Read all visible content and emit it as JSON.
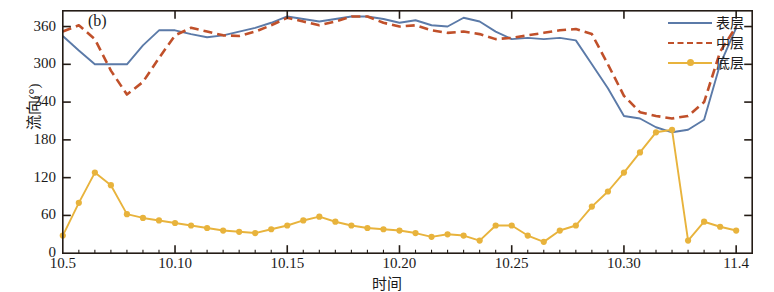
{
  "panel_label": "(b)",
  "axes": {
    "ylabel": "流向(°)",
    "xlabel": "时间",
    "yticks": [
      "0",
      "60",
      "120",
      "180",
      "240",
      "300",
      "360"
    ],
    "xticks": [
      "10.5",
      "10.10",
      "10.15",
      "10.20",
      "10.25",
      "10.30",
      "11.4"
    ]
  },
  "legend": {
    "items": [
      {
        "label": "表层",
        "color": "#5b7aa8",
        "style": "solid"
      },
      {
        "label": "中层",
        "color": "#c0502a",
        "style": "dashed"
      },
      {
        "label": "底层",
        "color": "#e8b33c",
        "style": "solid-marker"
      }
    ]
  },
  "chart_data": {
    "type": "line",
    "title": "(b)",
    "xlabel": "时间",
    "ylabel": "流向(°)",
    "ylim": [
      0,
      385
    ],
    "xlim": [
      0,
      43
    ],
    "grid": false,
    "legend_position": "top-right",
    "xtick_values": [
      0,
      7,
      14,
      21,
      28,
      35,
      42
    ],
    "xtick_labels": [
      "10.5",
      "10.10",
      "10.15",
      "10.20",
      "10.25",
      "10.30",
      "11.4"
    ],
    "ytick_values": [
      0,
      60,
      120,
      180,
      240,
      300,
      360
    ],
    "x": [
      0,
      1,
      2,
      3,
      4,
      5,
      6,
      7,
      8,
      9,
      10,
      11,
      12,
      13,
      14,
      15,
      16,
      17,
      18,
      19,
      20,
      21,
      22,
      23,
      24,
      25,
      26,
      27,
      28,
      29,
      30,
      31,
      32,
      33,
      34,
      35,
      36,
      37,
      38,
      39,
      40,
      41,
      42
    ],
    "series": [
      {
        "name": "表层",
        "color": "#5b7aa8",
        "style": "solid",
        "values": [
          345,
          322,
          300,
          300,
          300,
          330,
          354,
          354,
          348,
          343,
          346,
          352,
          358,
          366,
          376,
          372,
          368,
          372,
          376,
          376,
          372,
          366,
          370,
          362,
          360,
          374,
          368,
          352,
          340,
          342,
          340,
          342,
          338,
          300,
          262,
          218,
          214,
          200,
          192,
          196,
          212,
          300,
          358
        ]
      },
      {
        "name": "中层",
        "color": "#c0502a",
        "style": "dashed",
        "values": [
          352,
          362,
          340,
          290,
          252,
          272,
          310,
          346,
          358,
          352,
          346,
          345,
          352,
          362,
          374,
          368,
          362,
          368,
          376,
          376,
          366,
          360,
          362,
          354,
          350,
          352,
          348,
          340,
          342,
          346,
          350,
          354,
          356,
          348,
          300,
          250,
          224,
          218,
          214,
          218,
          240,
          320,
          360
        ]
      },
      {
        "name": "底层",
        "color": "#e8b33c",
        "style": "solid-marker",
        "values": [
          28,
          80,
          128,
          108,
          62,
          56,
          52,
          48,
          44,
          40,
          36,
          34,
          32,
          38,
          44,
          52,
          58,
          50,
          44,
          40,
          38,
          36,
          32,
          26,
          30,
          28,
          20,
          44,
          44,
          28,
          18,
          36,
          44,
          74,
          98,
          128,
          160,
          192,
          196,
          20,
          50,
          42,
          36
        ]
      }
    ]
  }
}
